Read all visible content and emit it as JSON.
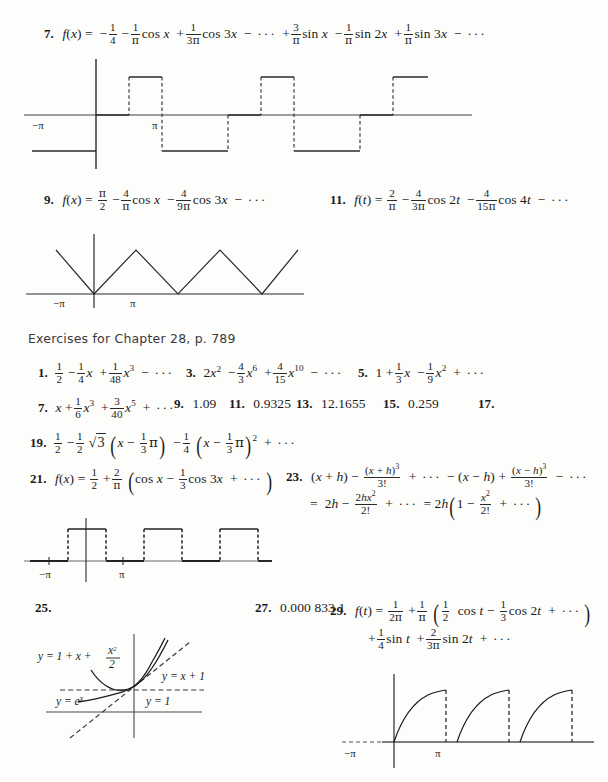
{
  "page": {
    "width": 608,
    "height": 782,
    "background": "#fdfdfc",
    "ink": "#1b1b1b"
  },
  "section_header": {
    "text": "Exercises for Chapter 28, p. 789"
  },
  "answers": [
    {
      "number": "7.",
      "kind": "fourier-series",
      "lhs": "f(x) =",
      "text": "f(x) = -1/4 - (1/π)cos x + (1/3π)cos 3x - ··· + (3/π)sin x - (1/π)sin 2x + (1/π)sin 3x - ···",
      "terms": [
        {
          "sign": "−",
          "num": "1",
          "den": "4",
          "fn": ""
        },
        {
          "sign": "−",
          "num": "1",
          "den": "π",
          "fn": "cos x"
        },
        {
          "sign": "+",
          "num": "1",
          "den": "3π",
          "fn": "cos 3x"
        },
        {
          "sign": "−",
          "num": "",
          "den": "",
          "fn": "···"
        },
        {
          "sign": "+",
          "num": "3",
          "den": "π",
          "fn": "sin x"
        },
        {
          "sign": "−",
          "num": "1",
          "den": "π",
          "fn": "sin 2x"
        },
        {
          "sign": "+",
          "num": "1",
          "den": "π",
          "fn": "sin 3x"
        },
        {
          "sign": "−",
          "num": "",
          "den": "",
          "fn": "···"
        }
      ]
    },
    {
      "number": "9.",
      "kind": "fourier-series",
      "text": "f(x) = π/2 - (4/π)cos x - (4/9π)cos 3x - ···"
    },
    {
      "number": "11.",
      "kind": "fourier-series",
      "text": "f(t) = 2/π - (4/3π)cos 2t - (4/15π)cos 4t - ···"
    },
    {
      "number": "1.",
      "kind": "power-series",
      "text": "1/2 - (1/4)x + (1/48)x³ - ···"
    },
    {
      "number": "3.",
      "kind": "power-series",
      "text": "2x² - (4/3)x⁶ + (4/15)x¹⁰ - ···"
    },
    {
      "number": "5.",
      "kind": "power-series",
      "text": "1 + (1/3)x - (1/9)x² + ···"
    },
    {
      "number": "7.",
      "kind": "power-series",
      "text": "x + (1/6)x³ + (3/40)x⁵ + ···"
    },
    {
      "number": "9.",
      "kind": "value",
      "value": "0.82"
    },
    {
      "number": "11.",
      "kind": "value",
      "value": "1.09"
    },
    {
      "number": "13.",
      "kind": "value",
      "value": "0.9325"
    },
    {
      "number": "15.",
      "kind": "value",
      "value": "12.1655"
    },
    {
      "number": "17.",
      "kind": "value",
      "value": "0.259"
    },
    {
      "number": "19.",
      "kind": "taylor-series",
      "text": "1/2 - (1/2)√3(x - π/3) - (1/4)(x - π/3)² + ···"
    },
    {
      "number": "21.",
      "kind": "fourier-series",
      "text": "f(x) = 1/2 + (2/π)(cos x - (1/3)cos 3x + ···)"
    },
    {
      "number": "23.",
      "kind": "identity",
      "line1": "(x + h) - (x + h)³/3! + ··· - (x - h) + (x - h)³/3! - ···",
      "line2": "= 2h - 2hx²/2! + ··· = 2h(1 - x²/2! + ···)"
    },
    {
      "number": "25.",
      "kind": "figure-only",
      "value": ""
    },
    {
      "number": "27.",
      "kind": "value",
      "value": "0.000 833 1"
    },
    {
      "number": "29.",
      "kind": "fourier-series",
      "line1": "f(t) = 1/2π + (1/π)((1/2)cos t - (1/3)cos 2t + ···)",
      "line2": "+ (1/4)sin t + (2/3π)sin 2t + ···"
    }
  ],
  "figures": [
    {
      "id": "fig-7-square-wave",
      "caption_for": "7.",
      "type": "step-square-wave",
      "axis_labels": {
        "left": "−π",
        "right": "π"
      },
      "description": "Piecewise constant square wave with dashed vertical jump segments, levels above and below the x-axis",
      "levels": [
        -1,
        0,
        1,
        -1,
        0,
        1,
        -1,
        0,
        1
      ],
      "period_marks": [
        "−π",
        "π"
      ]
    },
    {
      "id": "fig-9-triangle-wave",
      "caption_for": "9.",
      "type": "triangle-wave",
      "axis_labels": {
        "left": "−π",
        "right": "π"
      },
      "description": "V-shaped triangular wave touching the x-axis at multiples of 2π",
      "peaks": 4
    },
    {
      "id": "fig-21-square-pulse",
      "caption_for": "21.",
      "type": "square-pulse-train",
      "axis_labels": {
        "left": "−π",
        "right": "π"
      },
      "description": "Unipolar square pulse train, value 1 on alternating intervals, dashed vertical edges",
      "pulses": 3
    },
    {
      "id": "fig-25-exponential",
      "caption_for": "25.",
      "type": "curve-comparison",
      "curves": [
        {
          "label": "y = 1 + x + x²/2",
          "style": "solid-parabola"
        },
        {
          "label": "y = x + 1",
          "style": "dashed-line"
        },
        {
          "label": "y = e",
          "label_sup": "x",
          "style": "solid-exponential"
        },
        {
          "label": "y = 1",
          "style": "dashed-horizontal"
        }
      ],
      "description": "Graphs of e^x with its first and second degree Taylor polynomials near x = 0"
    },
    {
      "id": "fig-29-sawtooth",
      "caption_for": "29.",
      "type": "half-wave-sawtooth",
      "axis_labels": {
        "left": "−π",
        "right": "π"
      },
      "description": "Rising concave curve segments dropping vertically (dashed) back to the axis, repeating",
      "cycles": 3
    }
  ]
}
